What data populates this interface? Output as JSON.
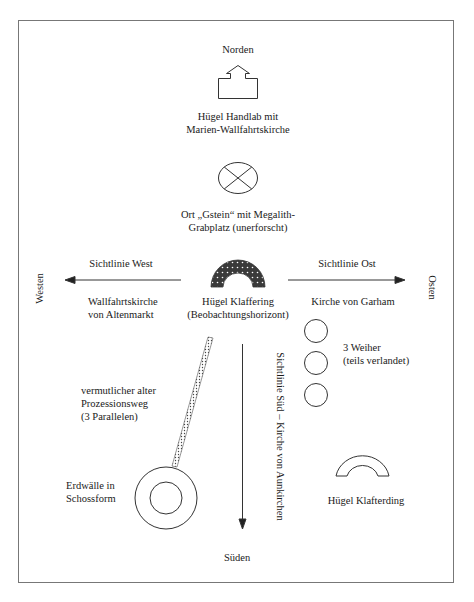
{
  "compass": {
    "north": "Norden",
    "south": "Süden",
    "west": "Westen",
    "east": "Osten"
  },
  "features": {
    "handlab": {
      "icon": "church-arrow-icon",
      "lines": [
        "Hügel Handlab mit",
        "Marien-Wallfahrtskirche"
      ]
    },
    "gstein": {
      "icon": "crossed-circle-icon",
      "lines": [
        "Ort „Gstein“ mit Megalith-",
        "Grabplatz (unerforscht)"
      ]
    },
    "klaffering": {
      "icon": "dotted-arch-icon",
      "lines": [
        "Hügel Klaffering",
        "(Beobachtungshorizont)"
      ]
    },
    "altenmarkt": {
      "lines": [
        "Wallfahrtskirche",
        "von Altenmarkt"
      ]
    },
    "garham": {
      "lines": [
        "Kirche von Garham"
      ]
    },
    "weiher": {
      "icon": "pond-circle-icon",
      "count": 3,
      "lines": [
        "3 Weiher",
        "(teils verlandet)"
      ]
    },
    "prozessionsweg": {
      "icon": "dotted-path-icon",
      "lines": [
        "vermutlicher alter",
        "Prozessionsweg",
        "(3 Parallelen)"
      ]
    },
    "erdwaelle": {
      "icon": "concentric-circles-icon",
      "lines": [
        "Erdwälle in",
        "Schossform"
      ]
    },
    "klafterding": {
      "icon": "arch-icon",
      "lines": [
        "Hügel Klafterding"
      ]
    }
  },
  "sightlines": {
    "west": "Sichtlinie West",
    "east": "Sichtlinie Ost",
    "south": "Sichtlinie Süd – Kirche von Aunkirchen"
  },
  "colors": {
    "stroke": "#333333",
    "frame": "#777777",
    "arch_fill": "#3a3a3a"
  }
}
